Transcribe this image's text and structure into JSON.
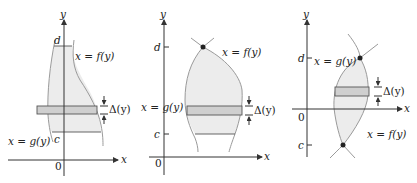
{
  "figure": {
    "panels": [
      {
        "id": "panel-1",
        "y_axis_label": "y",
        "x_axis_label": "x",
        "origin_label": "0",
        "upper_bound_label": "d",
        "lower_bound_label": "c",
        "right_curve_label": "x = f(y)",
        "left_curve_label": "x = g(y)",
        "strip_label": "Δ(y)"
      },
      {
        "id": "panel-2",
        "y_axis_label": "y",
        "x_axis_label": "x",
        "origin_label": "0",
        "upper_bound_label": "d",
        "lower_bound_label": "c",
        "right_curve_label": "x = f(y)",
        "left_curve_label": "x = g(y)",
        "strip_label": "Δ(y)"
      },
      {
        "id": "panel-3",
        "y_axis_label": "y",
        "x_axis_label": "x",
        "origin_label": "0",
        "upper_bound_label": "d",
        "lower_bound_label": "c",
        "left_curve_label": "x = g(y)",
        "right_curve_label": "x = f(y)",
        "strip_label": "Δ(y)"
      }
    ],
    "colors": {
      "region_fill": "#ececec",
      "strip_fill": "#cfcfcf",
      "curve_stroke": "#9a9a9a",
      "axis_stroke": "#333333"
    }
  }
}
